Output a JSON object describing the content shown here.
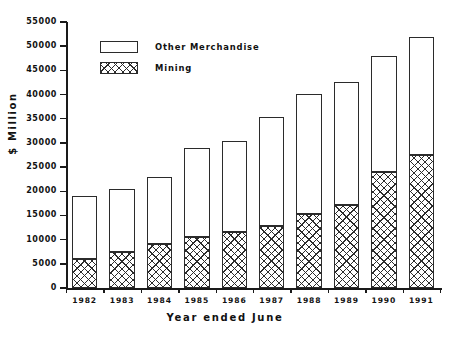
{
  "chart_data": {
    "type": "bar",
    "stacked": true,
    "title": "",
    "xlabel": "Year ended June",
    "ylabel": "$ Million",
    "ylim": [
      0,
      55000
    ],
    "ytick_step": 5000,
    "yticks": [
      0,
      5000,
      10000,
      15000,
      20000,
      25000,
      30000,
      35000,
      40000,
      45000,
      50000,
      55000
    ],
    "ytick_labels": [
      "0",
      "5000",
      "10000",
      "15000",
      "20000",
      "25000",
      "30000",
      "35000",
      "40000",
      "45000",
      "50000",
      "55000"
    ],
    "grid": false,
    "legend_position": "upper-left-inside",
    "categories": [
      "1982",
      "1983",
      "1984",
      "1985",
      "1986",
      "1987",
      "1988",
      "1989",
      "1990",
      "1991"
    ],
    "series": [
      {
        "name": "Mining",
        "fill": "cross-hatch",
        "values": [
          6000,
          7500,
          9100,
          10600,
          11600,
          12900,
          15300,
          17200,
          24000,
          27500
        ]
      },
      {
        "name": "Other Merchandise",
        "fill": "white",
        "values": [
          13000,
          13000,
          13900,
          18400,
          18700,
          22500,
          24900,
          25300,
          24000,
          24300
        ]
      }
    ],
    "totals": [
      19000,
      20500,
      23000,
      29000,
      30300,
      35400,
      40200,
      42500,
      48000,
      51800
    ]
  },
  "legend": {
    "items": [
      {
        "label": "Other Merchandise",
        "fill": "white"
      },
      {
        "label": "Mining",
        "fill": "cross-hatch"
      }
    ]
  },
  "colors": {
    "ink": "#2b2b2b",
    "background": "#ffffff"
  }
}
